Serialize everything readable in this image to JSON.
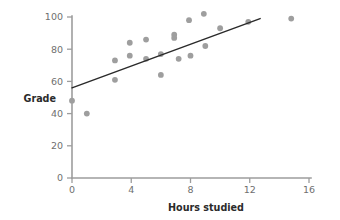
{
  "chart_data": {
    "type": "scatter",
    "title": "",
    "xlabel": "Hours studied",
    "ylabel": "Grade",
    "xlim": [
      0,
      16
    ],
    "ylim": [
      0,
      100
    ],
    "xticks": [
      0,
      4,
      8,
      12,
      16
    ],
    "yticks": [
      0,
      20,
      40,
      60,
      80,
      100
    ],
    "grid": false,
    "legend": null,
    "marker_color": "#9e9e9e",
    "trendline_color": "#2a2a2a",
    "axis_color": "#9d9d9d",
    "points": [
      {
        "x": 0.0,
        "y": 48
      },
      {
        "x": 1.0,
        "y": 40
      },
      {
        "x": 2.9,
        "y": 73
      },
      {
        "x": 2.9,
        "y": 61
      },
      {
        "x": 3.9,
        "y": 84
      },
      {
        "x": 3.9,
        "y": 76
      },
      {
        "x": 5.0,
        "y": 86
      },
      {
        "x": 5.0,
        "y": 74
      },
      {
        "x": 6.0,
        "y": 77
      },
      {
        "x": 6.0,
        "y": 64
      },
      {
        "x": 6.9,
        "y": 89
      },
      {
        "x": 6.9,
        "y": 87
      },
      {
        "x": 7.2,
        "y": 74
      },
      {
        "x": 7.9,
        "y": 98
      },
      {
        "x": 8.0,
        "y": 76
      },
      {
        "x": 8.9,
        "y": 102
      },
      {
        "x": 9.0,
        "y": 82
      },
      {
        "x": 10.0,
        "y": 93
      },
      {
        "x": 11.9,
        "y": 97
      },
      {
        "x": 14.8,
        "y": 99
      }
    ],
    "trendline": {
      "x_start": 0.0,
      "y_start": 56,
      "x_end": 12.7,
      "y_end": 99
    }
  },
  "series_label": "Grade vs Hours studied"
}
